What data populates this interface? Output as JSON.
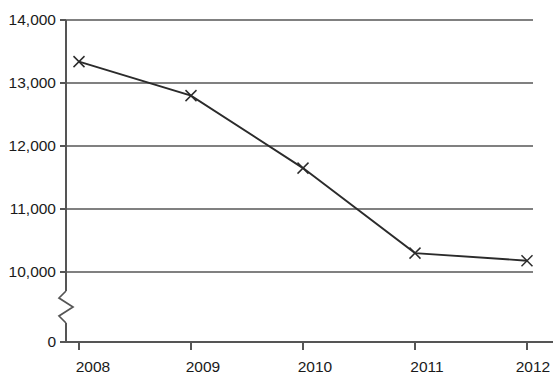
{
  "chart_data": {
    "type": "line",
    "title": "",
    "subtitle": "",
    "xlabel": "",
    "ylabel": "",
    "categories": [
      "2008",
      "2009",
      "2010",
      "2011",
      "2012"
    ],
    "x": [
      2008,
      2009,
      2010,
      2011,
      2012
    ],
    "series": [
      {
        "name": "",
        "values": [
          13340,
          12800,
          11650,
          10300,
          10180
        ],
        "marker": "x",
        "color": "#2b2b2b"
      }
    ],
    "values": [
      13340,
      12800,
      11650,
      10300,
      10180
    ],
    "ylim": [
      10000,
      14000
    ],
    "y_axis_break": true,
    "y_axis_break_note": "axis broken between 0 and 10,000",
    "y_tick_labels": [
      "14,000",
      "13,000",
      "12,000",
      "11,000",
      "10,000",
      "0"
    ],
    "y_tick_values": [
      14000,
      13000,
      12000,
      11000,
      10000,
      0
    ],
    "x_tick_labels": [
      "2008",
      "2009",
      "2010",
      "2011",
      "2012"
    ],
    "grid": true,
    "grid_orientation": "horizontal",
    "legend": false,
    "legend_position": "none",
    "gridline_color": "#808080",
    "axis_color": "#555555",
    "background_color": "#ffffff"
  },
  "axes": {
    "y_ticks": [
      {
        "label": "14,000",
        "value": 14000
      },
      {
        "label": "13,000",
        "value": 13000
      },
      {
        "label": "12,000",
        "value": 12000
      },
      {
        "label": "11,000",
        "value": 11000
      },
      {
        "label": "10,000",
        "value": 10000
      },
      {
        "label": "0",
        "value": 0
      }
    ],
    "x_ticks": [
      {
        "label": "2008",
        "value": 2008
      },
      {
        "label": "2009",
        "value": 2009
      },
      {
        "label": "2010",
        "value": 2010
      },
      {
        "label": "2011",
        "value": 2011
      },
      {
        "label": "2012",
        "value": 2012
      }
    ]
  }
}
